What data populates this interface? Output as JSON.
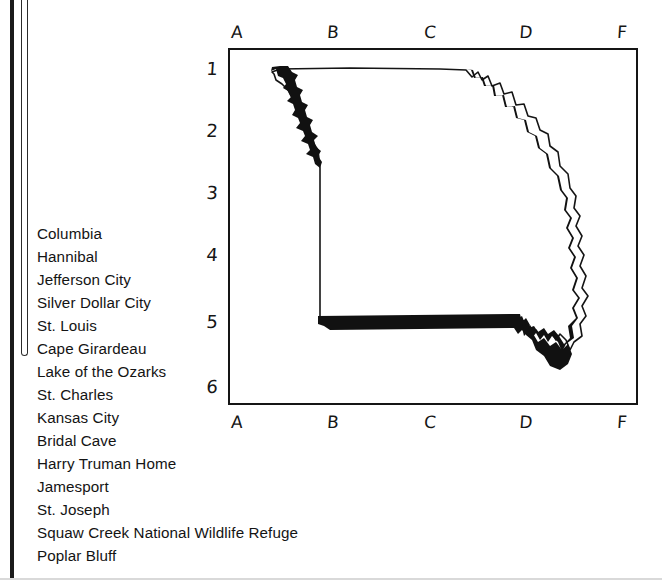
{
  "page": {
    "ink_color": "#151515",
    "paper_color": "#ffffff"
  },
  "margin": {
    "binding_bar": "page-binding-bar",
    "bracket": "margin-bracket"
  },
  "city_list": {
    "name": "missouri-places-list",
    "items": [
      "Columbia",
      "Hannibal",
      "Jefferson City",
      "Silver Dollar City",
      "St. Louis",
      "Cape Girardeau",
      "Lake of the Ozarks",
      "St. Charles",
      "Kansas City",
      "Bridal Cave",
      "Harry Truman Home",
      "Jamesport",
      "St. Joseph",
      "Squaw Creek National Wildlife Refuge",
      "Poplar Bluff"
    ]
  },
  "map": {
    "name": "missouri-grid-map",
    "subject": "Missouri state outline",
    "frame_color": "#151515",
    "column_labels_top": [
      "A",
      "B",
      "C",
      "D",
      "F"
    ],
    "column_labels_bottom": [
      "A",
      "B",
      "C",
      "D",
      "F"
    ],
    "row_labels": [
      "1",
      "2",
      "3",
      "4",
      "5",
      "6"
    ],
    "column_positions_px": [
      47,
      143,
      240,
      336,
      432
    ],
    "row_positions_px": [
      62,
      124,
      186,
      248,
      315,
      380
    ]
  }
}
